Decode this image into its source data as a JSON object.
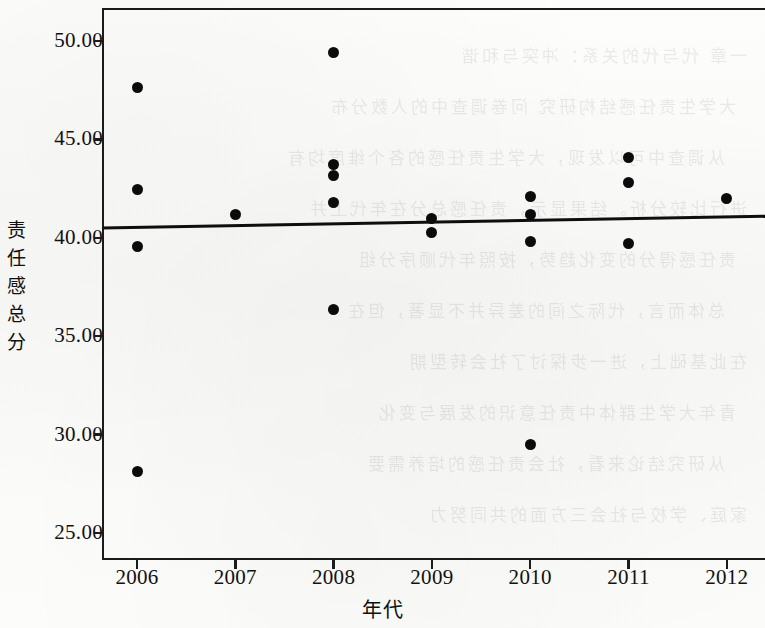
{
  "figure": {
    "background_color": "#fbfbfa",
    "ink_color": "#0b0b0b"
  },
  "axes": {
    "y_title": "责任感总分",
    "y_title_chars": [
      "责",
      "任",
      "感",
      "总",
      "分"
    ],
    "x_title": "年代",
    "y_ticks": [
      "50.00",
      "45.00",
      "40.00",
      "35.00",
      "30.00",
      "25.00"
    ],
    "x_ticks": [
      "2006",
      "2007",
      "2008",
      "2009",
      "2010",
      "2011",
      "2012"
    ]
  },
  "chart_data": {
    "type": "scatter",
    "title": "",
    "xlabel": "年代",
    "ylabel": "责任感总分",
    "xlim": [
      2005.6,
      2012.4
    ],
    "ylim": [
      23.5,
      51.2
    ],
    "ytick_values": [
      50.0,
      45.0,
      40.0,
      35.0,
      30.0,
      25.0
    ],
    "xtick_values": [
      2006,
      2007,
      2008,
      2009,
      2010,
      2011,
      2012
    ],
    "grid": false,
    "legend": false,
    "points": [
      {
        "x": 2006,
        "y": 47.65
      },
      {
        "x": 2006,
        "y": 42.45
      },
      {
        "x": 2006,
        "y": 39.55
      },
      {
        "x": 2006,
        "y": 28.1
      },
      {
        "x": 2007,
        "y": 41.2
      },
      {
        "x": 2008,
        "y": 49.4
      },
      {
        "x": 2008,
        "y": 43.75
      },
      {
        "x": 2008,
        "y": 43.15
      },
      {
        "x": 2008,
        "y": 41.8
      },
      {
        "x": 2008,
        "y": 36.35
      },
      {
        "x": 2009,
        "y": 41.0
      },
      {
        "x": 2009,
        "y": 40.25
      },
      {
        "x": 2010,
        "y": 42.1
      },
      {
        "x": 2010,
        "y": 41.2
      },
      {
        "x": 2010,
        "y": 39.8
      },
      {
        "x": 2010,
        "y": 29.5
      },
      {
        "x": 2011,
        "y": 44.1
      },
      {
        "x": 2011,
        "y": 42.8
      },
      {
        "x": 2011,
        "y": 39.7
      },
      {
        "x": 2012,
        "y": 42.0
      }
    ],
    "trend_line": {
      "type": "linear-fit",
      "x_start": 2005.65,
      "y_start": 40.5,
      "x_end": 2012.4,
      "y_end": 41.1
    }
  },
  "bleed_through_text": [
    "一章 代与代的关系：冲突与和谐",
    "大学生责任感结构研究 问卷调查中的人数分布",
    "从调查中可以发现，大学生责任感的各个维度均有",
    "进行比较分析。结果显示，责任感总分在年代上并",
    "责任感得分的变化趋势，按照年代顺序分组",
    "总体而言，代际之间的差异并不显著，但在",
    "在此基础上，进一步探讨了社会转型期",
    "青年大学生群体中责任意识的发展与变化",
    "从研究结论来看，社会责任感的培养需要",
    "家庭、学校与社会三方面的共同努力"
  ]
}
